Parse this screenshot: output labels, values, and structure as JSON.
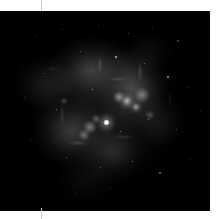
{
  "page": {
    "background_color": "#ffffff",
    "width": 223,
    "height": 219
  },
  "margin_rule": {
    "name": "vertical-guide-line",
    "x": 41,
    "color": "#c9c9c9"
  },
  "image_panel": {
    "label": "",
    "x": 0,
    "y": 11,
    "width": 210,
    "height": 200,
    "background_color": "#000000",
    "colormap": "grayscale",
    "subject": "nebula-field"
  },
  "chart_data": {
    "type": "heatmap",
    "title": "",
    "subtitle": "",
    "xlabel": "",
    "ylabel": "",
    "grid": false,
    "legend": "none",
    "colormap": "grayscale",
    "xlim": [
      0,
      210
    ],
    "ylim": [
      0,
      200
    ],
    "background": "#000000",
    "features": [
      {
        "name": "diffuse-glow-north",
        "cx": 92,
        "cy": 60,
        "rx": 58,
        "ry": 46,
        "intensity": 0.4
      },
      {
        "name": "diffuse-glow-northeast",
        "cx": 132,
        "cy": 78,
        "rx": 46,
        "ry": 54,
        "intensity": 0.42
      },
      {
        "name": "diffuse-glow-southwest",
        "cx": 72,
        "cy": 120,
        "rx": 52,
        "ry": 44,
        "intensity": 0.38
      },
      {
        "name": "diffuse-glow-south",
        "cx": 112,
        "cy": 140,
        "rx": 44,
        "ry": 40,
        "intensity": 0.3
      },
      {
        "name": "diffuse-glow-west",
        "cx": 44,
        "cy": 72,
        "rx": 40,
        "ry": 34,
        "intensity": 0.26
      },
      {
        "name": "diffuse-glow-east",
        "cx": 160,
        "cy": 112,
        "rx": 34,
        "ry": 30,
        "intensity": 0.2
      },
      {
        "name": "bright-knot-primary",
        "cx": 127,
        "cy": 90,
        "rx": 9,
        "ry": 9,
        "intensity": 0.75
      },
      {
        "name": "bright-knot-secondary",
        "cx": 136,
        "cy": 96,
        "rx": 7,
        "ry": 7,
        "intensity": 0.68
      },
      {
        "name": "bright-knot-southwest",
        "cx": 90,
        "cy": 116,
        "rx": 7,
        "ry": 7,
        "intensity": 0.52
      }
    ],
    "point_sources": [
      {
        "name": "primary-star",
        "x": 106,
        "y": 111,
        "size": 7,
        "brightness": 1.0
      },
      {
        "x": 35,
        "y": 25,
        "size": 1,
        "brightness": 0.55
      },
      {
        "x": 62,
        "y": 18,
        "size": 1,
        "brightness": 0.5
      },
      {
        "x": 98,
        "y": 14,
        "size": 1,
        "brightness": 0.45
      },
      {
        "x": 128,
        "y": 22,
        "size": 1,
        "brightness": 0.6
      },
      {
        "x": 152,
        "y": 16,
        "size": 1,
        "brightness": 0.5
      },
      {
        "x": 178,
        "y": 30,
        "size": 1.5,
        "brightness": 0.7
      },
      {
        "x": 196,
        "y": 44,
        "size": 1,
        "brightness": 0.55
      },
      {
        "x": 18,
        "y": 48,
        "size": 1,
        "brightness": 0.45
      },
      {
        "x": 44,
        "y": 62,
        "size": 1,
        "brightness": 0.5
      },
      {
        "x": 80,
        "y": 40,
        "size": 1,
        "brightness": 0.55
      },
      {
        "x": 116,
        "y": 46,
        "size": 1.5,
        "brightness": 0.65
      },
      {
        "x": 144,
        "y": 52,
        "size": 1,
        "brightness": 0.5
      },
      {
        "x": 168,
        "y": 66,
        "size": 1.5,
        "brightness": 0.68
      },
      {
        "x": 188,
        "y": 76,
        "size": 1,
        "brightness": 0.5
      },
      {
        "x": 24,
        "y": 86,
        "size": 1,
        "brightness": 0.45
      },
      {
        "x": 56,
        "y": 98,
        "size": 1,
        "brightness": 0.5
      },
      {
        "x": 148,
        "y": 108,
        "size": 1,
        "brightness": 0.55
      },
      {
        "x": 176,
        "y": 118,
        "size": 1,
        "brightness": 0.5
      },
      {
        "x": 200,
        "y": 100,
        "size": 1,
        "brightness": 0.45
      },
      {
        "x": 30,
        "y": 128,
        "size": 1,
        "brightness": 0.5
      },
      {
        "x": 66,
        "y": 146,
        "size": 1,
        "brightness": 0.52
      },
      {
        "x": 100,
        "y": 156,
        "size": 1,
        "brightness": 0.48
      },
      {
        "x": 132,
        "y": 150,
        "size": 1,
        "brightness": 0.55
      },
      {
        "x": 160,
        "y": 162,
        "size": 1.5,
        "brightness": 0.62
      },
      {
        "x": 190,
        "y": 148,
        "size": 1,
        "brightness": 0.5
      },
      {
        "x": 42,
        "y": 170,
        "size": 1,
        "brightness": 0.45
      },
      {
        "x": 76,
        "y": 182,
        "size": 1,
        "brightness": 0.48
      },
      {
        "x": 110,
        "y": 176,
        "size": 1,
        "brightness": 0.5
      },
      {
        "x": 146,
        "y": 188,
        "size": 1,
        "brightness": 0.46
      },
      {
        "x": 182,
        "y": 192,
        "size": 1,
        "brightness": 0.44
      },
      {
        "x": 14,
        "y": 156,
        "size": 1,
        "brightness": 0.42
      },
      {
        "x": 204,
        "y": 170,
        "size": 1,
        "brightness": 0.44
      },
      {
        "x": 92,
        "y": 78,
        "size": 1,
        "brightness": 0.58
      },
      {
        "x": 120,
        "y": 120,
        "size": 1,
        "brightness": 0.52
      }
    ]
  }
}
